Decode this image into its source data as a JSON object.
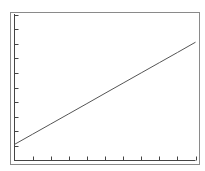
{
  "chart_data": {
    "type": "line",
    "title": "",
    "xlabel": "",
    "ylabel": "",
    "x": [
      0,
      1,
      2,
      3,
      4,
      5,
      6,
      7,
      8,
      9,
      10
    ],
    "series": [
      {
        "name": "",
        "values": [
          1.1,
          1.8,
          2.5,
          3.2,
          3.9,
          4.6,
          5.3,
          6.0,
          6.7,
          7.4,
          8.1
        ],
        "color": "#555555"
      }
    ],
    "xlim": [
      0,
      10
    ],
    "ylim": [
      0,
      10
    ],
    "x_ticks": [
      1,
      2,
      3,
      4,
      5,
      6,
      7,
      8,
      9,
      10
    ],
    "y_ticks": [
      1,
      2,
      3,
      4,
      5,
      6,
      7,
      8,
      9,
      10
    ],
    "x_tick_labels": [],
    "y_tick_labels": [],
    "grid": false,
    "legend": null
  },
  "style": {
    "frame_color": "#8a8a8a",
    "axis_color": "#444444",
    "line_color": "#555555",
    "background": "#ffffff"
  }
}
